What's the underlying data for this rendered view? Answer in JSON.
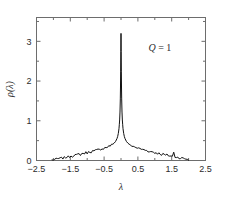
{
  "figure": {
    "name": "eigenvalue-density-plot",
    "background_color": "#ffffff",
    "frame_color": "#6d6d6d",
    "curve_color": "#101010"
  },
  "annotation": {
    "symbol": "Q",
    "equals": " = ",
    "value": "1",
    "full_text": "Q = 1"
  },
  "axis_titles": {
    "x": "λ",
    "y": "ρ(λ)"
  },
  "chart_data": {
    "type": "line",
    "title": "",
    "subtitle": "",
    "xlabel": "λ",
    "ylabel": "ρ(λ)",
    "xlim": [
      -2.5,
      2.5
    ],
    "ylim": [
      0,
      3.6
    ],
    "grid": false,
    "legend": null,
    "annotations": [
      {
        "text": "Q = 1",
        "x": 1.15,
        "y": 2.75
      }
    ],
    "xticks": [
      -2.5,
      -1.5,
      -0.5,
      0.5,
      1.5,
      2.5
    ],
    "xticklabels": [
      "-2.5",
      "-1.5",
      "-0.5",
      "0.5",
      "1.5",
      "2.5"
    ],
    "xminorticks": [
      -2.0,
      -1.0,
      0.0,
      1.0,
      2.0
    ],
    "yticks": [
      0,
      1,
      2,
      3
    ],
    "yticklabels": [
      "0",
      "1",
      "2",
      "3"
    ],
    "yminorticks": [
      0.5,
      1.5,
      2.5,
      3.5
    ],
    "peak": {
      "x": 0.0,
      "y": 3.2
    },
    "series": [
      {
        "name": "rho(lambda)",
        "x": [
          -2.04,
          -2.0,
          -1.96,
          -1.92,
          -1.88,
          -1.84,
          -1.8,
          -1.76,
          -1.72,
          -1.68,
          -1.64,
          -1.6,
          -1.56,
          -1.52,
          -1.48,
          -1.44,
          -1.4,
          -1.36,
          -1.32,
          -1.28,
          -1.24,
          -1.2,
          -1.16,
          -1.12,
          -1.08,
          -1.04,
          -1.0,
          -0.96,
          -0.92,
          -0.88,
          -0.84,
          -0.8,
          -0.76,
          -0.72,
          -0.68,
          -0.64,
          -0.6,
          -0.56,
          -0.52,
          -0.48,
          -0.44,
          -0.4,
          -0.36,
          -0.32,
          -0.28,
          -0.24,
          -0.2,
          -0.16,
          -0.12,
          -0.1,
          -0.08,
          -0.06,
          -0.05,
          -0.04,
          -0.03,
          -0.02,
          -0.015,
          -0.01,
          -0.005,
          0.0,
          0.005,
          0.01,
          0.015,
          0.02,
          0.03,
          0.04,
          0.05,
          0.06,
          0.08,
          0.1,
          0.12,
          0.16,
          0.2,
          0.24,
          0.28,
          0.32,
          0.36,
          0.4,
          0.44,
          0.48,
          0.52,
          0.56,
          0.6,
          0.64,
          0.68,
          0.72,
          0.76,
          0.8,
          0.84,
          0.88,
          0.92,
          0.96,
          1.0,
          1.04,
          1.08,
          1.12,
          1.16,
          1.2,
          1.24,
          1.28,
          1.32,
          1.36,
          1.4,
          1.44,
          1.48,
          1.52,
          1.56,
          1.6,
          1.64,
          1.68,
          1.72,
          1.76,
          1.8,
          1.84,
          1.88,
          1.92,
          1.96,
          2.0
        ],
        "y": [
          0.01,
          0.02,
          0.03,
          0.03,
          0.04,
          0.05,
          0.05,
          0.06,
          0.06,
          0.07,
          0.08,
          0.09,
          0.09,
          0.1,
          0.12,
          0.11,
          0.13,
          0.14,
          0.13,
          0.15,
          0.16,
          0.15,
          0.17,
          0.18,
          0.18,
          0.2,
          0.19,
          0.21,
          0.22,
          0.22,
          0.24,
          0.23,
          0.25,
          0.26,
          0.27,
          0.27,
          0.29,
          0.3,
          0.3,
          0.32,
          0.33,
          0.34,
          0.36,
          0.37,
          0.39,
          0.41,
          0.44,
          0.48,
          0.55,
          0.6,
          0.68,
          0.8,
          0.9,
          1.02,
          1.22,
          1.55,
          1.85,
          2.25,
          2.75,
          3.2,
          2.75,
          2.25,
          1.85,
          1.55,
          1.22,
          1.02,
          0.9,
          0.8,
          0.68,
          0.6,
          0.55,
          0.48,
          0.44,
          0.41,
          0.39,
          0.37,
          0.36,
          0.34,
          0.33,
          0.32,
          0.3,
          0.3,
          0.29,
          0.27,
          0.27,
          0.26,
          0.25,
          0.23,
          0.24,
          0.22,
          0.22,
          0.21,
          0.19,
          0.2,
          0.18,
          0.18,
          0.17,
          0.15,
          0.16,
          0.15,
          0.13,
          0.14,
          0.13,
          0.11,
          0.12,
          0.1,
          0.2,
          0.09,
          0.09,
          0.08,
          0.07,
          0.06,
          0.06,
          0.05,
          0.05,
          0.04,
          0.03,
          0.02
        ]
      }
    ]
  }
}
